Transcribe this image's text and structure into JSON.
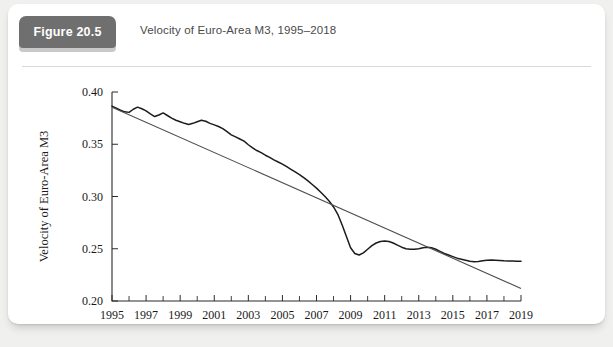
{
  "figure": {
    "badge_label": "Figure 20.5",
    "title": "Velocity of Euro-Area M3, 1995–2018",
    "badge_color": "#6f6f6f",
    "badge_shadow_color": "#c9c9c9",
    "card_background": "#ffffff",
    "page_background": "#f0f0ef"
  },
  "chart_data": {
    "type": "line",
    "title": "Velocity of Euro-Area M3, 1995–2018",
    "xlabel": "",
    "ylabel": "Velocity of Euro-Area M3",
    "xlim": [
      1995,
      2019
    ],
    "ylim": [
      0.2,
      0.4
    ],
    "yticks": [
      0.2,
      0.25,
      0.3,
      0.35,
      0.4
    ],
    "ytick_labels": [
      "0.20",
      "0.25",
      "0.30",
      "0.35",
      "0.40"
    ],
    "xticks": [
      1995,
      1997,
      1999,
      2001,
      2003,
      2005,
      2007,
      2009,
      2011,
      2013,
      2015,
      2017,
      2019
    ],
    "xtick_labels": [
      "1995",
      "1997",
      "1999",
      "2001",
      "2003",
      "2005",
      "2007",
      "2009",
      "2011",
      "2013",
      "2015",
      "2017",
      "2019"
    ],
    "xticks_minor": [
      1996,
      1998,
      2000,
      2002,
      2004,
      2006,
      2008,
      2010,
      2012,
      2014,
      2016,
      2018
    ],
    "grid": false,
    "legend": "none",
    "series": [
      {
        "name": "Velocity of Euro-Area M3",
        "color": "#1c1c1c",
        "style": "solid",
        "x": [
          1995.0,
          1995.25,
          1995.5,
          1995.75,
          1996.0,
          1996.25,
          1996.5,
          1996.75,
          1997.0,
          1997.25,
          1997.5,
          1997.75,
          1998.0,
          1998.25,
          1998.5,
          1998.75,
          1999.0,
          1999.25,
          1999.5,
          1999.75,
          2000.0,
          2000.25,
          2000.5,
          2000.75,
          2001.0,
          2001.25,
          2001.5,
          2001.75,
          2002.0,
          2002.25,
          2002.5,
          2002.75,
          2003.0,
          2003.25,
          2003.5,
          2003.75,
          2004.0,
          2004.25,
          2004.5,
          2004.75,
          2005.0,
          2005.25,
          2005.5,
          2005.75,
          2006.0,
          2006.25,
          2006.5,
          2006.75,
          2007.0,
          2007.25,
          2007.5,
          2007.75,
          2008.0,
          2008.25,
          2008.5,
          2008.75,
          2009.0,
          2009.25,
          2009.5,
          2009.75,
          2010.0,
          2010.25,
          2010.5,
          2010.75,
          2011.0,
          2011.25,
          2011.5,
          2011.75,
          2012.0,
          2012.25,
          2012.5,
          2012.75,
          2013.0,
          2013.25,
          2013.5,
          2013.75,
          2014.0,
          2014.25,
          2014.5,
          2014.75,
          2015.0,
          2015.25,
          2015.5,
          2015.75,
          2016.0,
          2016.25,
          2016.5,
          2016.75,
          2017.0,
          2017.25,
          2017.5,
          2017.75,
          2018.0,
          2018.25,
          2018.5,
          2018.75,
          2019.0
        ],
        "y": [
          0.3865,
          0.3845,
          0.3825,
          0.381,
          0.3805,
          0.3835,
          0.3855,
          0.384,
          0.382,
          0.379,
          0.3765,
          0.378,
          0.38,
          0.3775,
          0.375,
          0.373,
          0.3715,
          0.37,
          0.369,
          0.37,
          0.3715,
          0.373,
          0.372,
          0.37,
          0.3685,
          0.367,
          0.365,
          0.362,
          0.359,
          0.357,
          0.355,
          0.353,
          0.3495,
          0.3465,
          0.344,
          0.342,
          0.3395,
          0.3375,
          0.335,
          0.333,
          0.331,
          0.3285,
          0.326,
          0.3235,
          0.321,
          0.318,
          0.315,
          0.3115,
          0.308,
          0.304,
          0.3,
          0.2955,
          0.29,
          0.283,
          0.273,
          0.262,
          0.251,
          0.2455,
          0.244,
          0.246,
          0.2495,
          0.253,
          0.2555,
          0.257,
          0.2575,
          0.257,
          0.2555,
          0.2535,
          0.2515,
          0.25,
          0.2495,
          0.2495,
          0.25,
          0.251,
          0.2515,
          0.251,
          0.2495,
          0.2475,
          0.2455,
          0.244,
          0.2425,
          0.241,
          0.24,
          0.239,
          0.238,
          0.2375,
          0.2378,
          0.2385,
          0.239,
          0.2392,
          0.239,
          0.2388,
          0.2385,
          0.2383,
          0.2382,
          0.2381,
          0.238
        ]
      },
      {
        "name": "Linear trend",
        "color": "#4d4d4d",
        "style": "solid-thin",
        "x": [
          1995,
          2019
        ],
        "y": [
          0.3855,
          0.212
        ]
      }
    ]
  }
}
